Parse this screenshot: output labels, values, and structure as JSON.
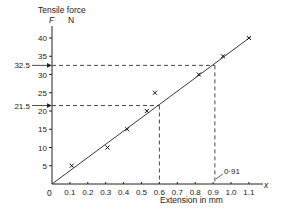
{
  "chart_data": {
    "type": "scatter",
    "title": "",
    "ylabel_line1": "Tensile force",
    "ylabel_symbol": "F",
    "ylabel_unit": "N",
    "xlabel": "Extension in mm",
    "x_axis_symbol": "x",
    "origin_label": "0",
    "xlim": [
      0,
      1.1
    ],
    "ylim": [
      0,
      40
    ],
    "x_ticks": [
      "0.1",
      "0.2",
      "0.3",
      "0.4",
      "0.5",
      "0.6",
      "0.7",
      "0.8",
      "0.9",
      "1.0",
      "1.1"
    ],
    "x_tick_values": [
      0.1,
      0.2,
      0.3,
      0.4,
      0.5,
      0.6,
      0.7,
      0.8,
      0.9,
      1.0,
      1.1
    ],
    "y_ticks": [
      "5",
      "10",
      "15",
      "20",
      "25",
      "30",
      "35",
      "40"
    ],
    "y_tick_values": [
      5,
      10,
      15,
      20,
      25,
      30,
      35,
      40
    ],
    "grid": false,
    "series": [
      {
        "name": "Measured points",
        "marker": "x",
        "points": [
          {
            "x": 0.11,
            "y": 5
          },
          {
            "x": 0.31,
            "y": 10
          },
          {
            "x": 0.42,
            "y": 15
          },
          {
            "x": 0.53,
            "y": 20
          },
          {
            "x": 0.575,
            "y": 25
          },
          {
            "x": 0.82,
            "y": 30
          },
          {
            "x": 0.955,
            "y": 35
          },
          {
            "x": 1.1,
            "y": 40
          }
        ]
      },
      {
        "name": "Best-fit line",
        "type": "line",
        "points": [
          {
            "x": 0,
            "y": 0
          },
          {
            "x": 1.11,
            "y": 40.3
          }
        ]
      }
    ],
    "annotations": [
      {
        "label": "32.5",
        "y": 32.5,
        "x": 0.91,
        "kind": "dashed-readoff"
      },
      {
        "label": "21.5",
        "y": 21.5,
        "x": 0.6,
        "kind": "dashed-readoff"
      },
      {
        "label": "0·91",
        "x": 0.91,
        "kind": "x-callout"
      }
    ]
  }
}
